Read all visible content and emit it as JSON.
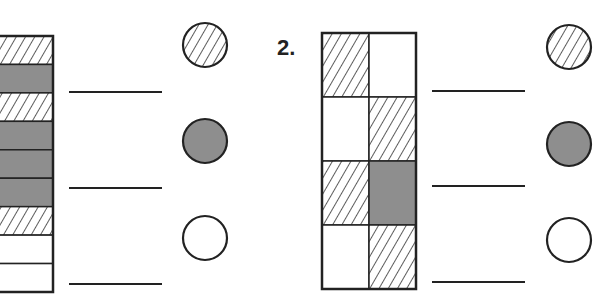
{
  "colors": {
    "stroke": "#222222",
    "gray": "#8e8e8e",
    "white": "#ffffff",
    "hatch": "#333333"
  },
  "problems": [
    {
      "number": "",
      "layout": "stripes",
      "cells": [
        "hatched",
        "gray",
        "hatched",
        "gray",
        "gray",
        "gray",
        "hatched",
        "white",
        "white"
      ],
      "legend": [
        {
          "fill": "hatched",
          "answer": ""
        },
        {
          "fill": "gray",
          "answer": ""
        },
        {
          "fill": "white",
          "answer": ""
        }
      ]
    },
    {
      "number": "2.",
      "layout": "grid-4x2",
      "cells": [
        [
          "hatched",
          "white"
        ],
        [
          "white",
          "hatched"
        ],
        [
          "hatched",
          "gray"
        ],
        [
          "white",
          "hatched"
        ]
      ],
      "legend": [
        {
          "fill": "hatched",
          "answer": ""
        },
        {
          "fill": "gray",
          "answer": ""
        },
        {
          "fill": "white",
          "answer": ""
        }
      ]
    }
  ]
}
